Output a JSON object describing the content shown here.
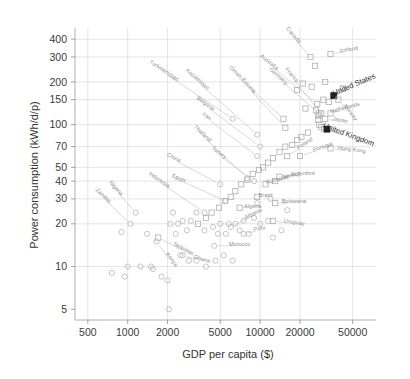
{
  "chart_data": {
    "type": "scatter",
    "title": "",
    "xlabel": "GDP per capita ($)",
    "ylabel": "Power consumption (kWh/d/p)",
    "xscale": "log",
    "yscale": "log",
    "xlim": [
      400,
      75000
    ],
    "ylim": [
      4.2,
      480
    ],
    "grid": true,
    "legend": "none",
    "xticks": [
      500,
      1000,
      2000,
      5000,
      10000,
      20000,
      50000
    ],
    "xtick_labels": [
      "500",
      "1000",
      "2000",
      "5000",
      "10000",
      "20000",
      "50000"
    ],
    "yticks": [
      5,
      10,
      20,
      30,
      40,
      50,
      70,
      100,
      150,
      200,
      300,
      400
    ],
    "ytick_labels": [
      "5",
      "10",
      "20",
      "30",
      "40",
      "50",
      "70",
      "100",
      "150",
      "200",
      "300",
      "400"
    ],
    "marker_types": [
      "square",
      "circle",
      "filled-square"
    ],
    "highlighted": [
      "United States",
      "United Kingdom"
    ],
    "points": [
      {
        "name": "Canada",
        "x": 24000,
        "y": 300,
        "marker": "square",
        "label_x": 17500,
        "label_y": 420
      },
      {
        "name": "Iceland",
        "x": 34000,
        "y": 315,
        "marker": "square",
        "label_x": 47000,
        "label_y": 330
      },
      {
        "name": "United States",
        "x": 36000,
        "y": 160,
        "marker": "filled-square",
        "label_x": 52000,
        "label_y": 185
      },
      {
        "name": "Norway",
        "x": 39000,
        "y": 150,
        "marker": "square",
        "label_x": 47000,
        "label_y": 120
      },
      {
        "name": "Australia",
        "x": 27000,
        "y": 140,
        "marker": "square",
        "label_x": 11500,
        "label_y": 270
      },
      {
        "name": "Germany",
        "x": 28000,
        "y": 120,
        "marker": "square",
        "label_x": 13500,
        "label_y": 215
      },
      {
        "name": "France",
        "x": 29000,
        "y": 120,
        "marker": "square",
        "label_x": 17000,
        "label_y": 220
      },
      {
        "name": "Netherlands",
        "x": 34000,
        "y": 120,
        "marker": "square",
        "label_x": 44000,
        "label_y": 128
      },
      {
        "name": "Japan",
        "x": 31000,
        "y": 110,
        "marker": "square",
        "label_x": 40000,
        "label_y": 105
      },
      {
        "name": "United Kingdom",
        "x": 32000,
        "y": 93,
        "marker": "filled-square",
        "label_x": 46000,
        "label_y": 82
      },
      {
        "name": "Hong Kong",
        "x": 34000,
        "y": 68,
        "marker": "square",
        "label_x": 49000,
        "label_y": 65
      },
      {
        "name": "Oman",
        "x": 15000,
        "y": 110,
        "marker": "square",
        "label_x": 6400,
        "label_y": 230
      },
      {
        "name": "Estonia",
        "x": 15500,
        "y": 95,
        "marker": "square",
        "label_x": 8000,
        "label_y": 185
      },
      {
        "name": "Portugal",
        "x": 20000,
        "y": 60,
        "marker": "square",
        "label_x": 30000,
        "label_y": 68
      },
      {
        "name": "Poland",
        "x": 16000,
        "y": 60,
        "marker": "square",
        "label_x": 22000,
        "label_y": 72
      },
      {
        "name": "Argentina",
        "x": 14000,
        "y": 43,
        "marker": "square",
        "label_x": 21000,
        "label_y": 44
      },
      {
        "name": "Mexico",
        "x": 13000,
        "y": 40,
        "marker": "square",
        "label_x": 17500,
        "label_y": 43
      },
      {
        "name": "Romania",
        "x": 11000,
        "y": 38,
        "marker": "square",
        "label_x": 13500,
        "label_y": 40
      },
      {
        "name": "Botswana",
        "x": 13000,
        "y": 28,
        "marker": "square",
        "label_x": 18000,
        "label_y": 28
      },
      {
        "name": "Brazil",
        "x": 9500,
        "y": 31,
        "marker": "square",
        "label_x": 11000,
        "label_y": 31
      },
      {
        "name": "Algeria",
        "x": 7000,
        "y": 26,
        "marker": "square",
        "label_x": 8800,
        "label_y": 26
      },
      {
        "name": "Uruguay",
        "x": 12500,
        "y": 21,
        "marker": "square",
        "label_x": 18000,
        "label_y": 20
      },
      {
        "name": "Albania",
        "x": 6000,
        "y": 19,
        "marker": "circle",
        "label_x": 9000,
        "label_y": 23
      },
      {
        "name": "Peru",
        "x": 7500,
        "y": 17,
        "marker": "circle",
        "label_x": 10000,
        "label_y": 18
      },
      {
        "name": "Morocco",
        "x": 4500,
        "y": 14,
        "marker": "circle",
        "label_x": 7000,
        "label_y": 14
      },
      {
        "name": "Turkmenistan",
        "x": 6200,
        "y": 110,
        "marker": "circle",
        "label_x": 1850,
        "label_y": 235
      },
      {
        "name": "Kazakhstan",
        "x": 9500,
        "y": 85,
        "marker": "circle",
        "label_x": 3300,
        "label_y": 205
      },
      {
        "name": "Bulgaria",
        "x": 10000,
        "y": 70,
        "marker": "circle",
        "label_x": 3800,
        "label_y": 138
      },
      {
        "name": "Iran",
        "x": 9500,
        "y": 60,
        "marker": "circle",
        "label_x": 3900,
        "label_y": 112
      },
      {
        "name": "Thailand",
        "x": 8000,
        "y": 42,
        "marker": "circle",
        "label_x": 3600,
        "label_y": 85
      },
      {
        "name": "Turkey",
        "x": 9000,
        "y": 40,
        "marker": "circle",
        "label_x": 4800,
        "label_y": 62
      },
      {
        "name": "China",
        "x": 5000,
        "y": 38,
        "marker": "circle",
        "label_x": 2200,
        "label_y": 57
      },
      {
        "name": "Egypt",
        "x": 5500,
        "y": 29,
        "marker": "circle",
        "label_x": 2400,
        "label_y": 41
      },
      {
        "name": "Indonesia",
        "x": 3800,
        "y": 24,
        "marker": "circle",
        "label_x": 1700,
        "label_y": 40
      },
      {
        "name": "Nigeria",
        "x": 1150,
        "y": 24,
        "marker": "circle",
        "label_x": 800,
        "label_y": 35
      },
      {
        "name": "Zambia",
        "x": 1050,
        "y": 20,
        "marker": "circle",
        "label_x": 640,
        "label_y": 31
      },
      {
        "name": "Tajikistan",
        "x": 1700,
        "y": 16,
        "marker": "square",
        "label_x": 2600,
        "label_y": 13
      },
      {
        "name": "Kenya",
        "x": 1650,
        "y": 15,
        "marker": "circle",
        "label_x": 2100,
        "label_y": 11
      },
      {
        "name": "Ghana",
        "x": 2600,
        "y": 12,
        "marker": "circle",
        "label_x": 3600,
        "label_y": 11
      }
    ],
    "unlabeled_points": [
      {
        "x": 26000,
        "y": 260,
        "marker": "square"
      },
      {
        "x": 21000,
        "y": 195,
        "marker": "square"
      },
      {
        "x": 24500,
        "y": 185,
        "marker": "square"
      },
      {
        "x": 31000,
        "y": 200,
        "marker": "square"
      },
      {
        "x": 42000,
        "y": 180,
        "marker": "square"
      },
      {
        "x": 19000,
        "y": 175,
        "marker": "square"
      },
      {
        "x": 30000,
        "y": 150,
        "marker": "square"
      },
      {
        "x": 33000,
        "y": 145,
        "marker": "square"
      },
      {
        "x": 22000,
        "y": 130,
        "marker": "square"
      },
      {
        "x": 26500,
        "y": 126,
        "marker": "square"
      },
      {
        "x": 27500,
        "y": 116,
        "marker": "square"
      },
      {
        "x": 27500,
        "y": 108,
        "marker": "square"
      },
      {
        "x": 28000,
        "y": 100,
        "marker": "square"
      },
      {
        "x": 29000,
        "y": 96,
        "marker": "square"
      },
      {
        "x": 30500,
        "y": 93,
        "marker": "square"
      },
      {
        "x": 23000,
        "y": 88,
        "marker": "square"
      },
      {
        "x": 20500,
        "y": 82,
        "marker": "square"
      },
      {
        "x": 19000,
        "y": 78,
        "marker": "square"
      },
      {
        "x": 17500,
        "y": 72,
        "marker": "square"
      },
      {
        "x": 15500,
        "y": 70,
        "marker": "square"
      },
      {
        "x": 14000,
        "y": 64,
        "marker": "square"
      },
      {
        "x": 12500,
        "y": 58,
        "marker": "square"
      },
      {
        "x": 11500,
        "y": 54,
        "marker": "square"
      },
      {
        "x": 10500,
        "y": 50,
        "marker": "square"
      },
      {
        "x": 9800,
        "y": 48,
        "marker": "square"
      },
      {
        "x": 8800,
        "y": 45,
        "marker": "square"
      },
      {
        "x": 8000,
        "y": 41,
        "marker": "square"
      },
      {
        "x": 7200,
        "y": 38,
        "marker": "square"
      },
      {
        "x": 6500,
        "y": 34,
        "marker": "square"
      },
      {
        "x": 6000,
        "y": 31,
        "marker": "square"
      },
      {
        "x": 5400,
        "y": 29,
        "marker": "square"
      },
      {
        "x": 4900,
        "y": 26,
        "marker": "square"
      },
      {
        "x": 4300,
        "y": 24,
        "marker": "square"
      },
      {
        "x": 3900,
        "y": 22,
        "marker": "square"
      },
      {
        "x": 3400,
        "y": 20,
        "marker": "square"
      },
      {
        "x": 5000,
        "y": 20,
        "marker": "circle"
      },
      {
        "x": 5800,
        "y": 20,
        "marker": "circle"
      },
      {
        "x": 6500,
        "y": 20,
        "marker": "circle"
      },
      {
        "x": 4400,
        "y": 19,
        "marker": "circle"
      },
      {
        "x": 3800,
        "y": 18,
        "marker": "circle"
      },
      {
        "x": 4800,
        "y": 17,
        "marker": "circle"
      },
      {
        "x": 5500,
        "y": 17,
        "marker": "circle"
      },
      {
        "x": 7000,
        "y": 18,
        "marker": "circle"
      },
      {
        "x": 8200,
        "y": 17,
        "marker": "circle"
      },
      {
        "x": 3300,
        "y": 24,
        "marker": "circle"
      },
      {
        "x": 3000,
        "y": 21,
        "marker": "circle"
      },
      {
        "x": 2800,
        "y": 18,
        "marker": "circle"
      },
      {
        "x": 2300,
        "y": 17,
        "marker": "circle"
      },
      {
        "x": 2500,
        "y": 12,
        "marker": "circle"
      },
      {
        "x": 2900,
        "y": 11,
        "marker": "circle"
      },
      {
        "x": 3300,
        "y": 11,
        "marker": "circle"
      },
      {
        "x": 3900,
        "y": 10,
        "marker": "circle"
      },
      {
        "x": 4600,
        "y": 11,
        "marker": "circle"
      },
      {
        "x": 5300,
        "y": 12,
        "marker": "circle"
      },
      {
        "x": 6200,
        "y": 11,
        "marker": "circle"
      },
      {
        "x": 1400,
        "y": 17,
        "marker": "circle"
      },
      {
        "x": 1500,
        "y": 10,
        "marker": "circle"
      },
      {
        "x": 1250,
        "y": 10,
        "marker": "circle"
      },
      {
        "x": 1000,
        "y": 10,
        "marker": "circle"
      },
      {
        "x": 950,
        "y": 8.5,
        "marker": "circle"
      },
      {
        "x": 760,
        "y": 9,
        "marker": "circle"
      },
      {
        "x": 900,
        "y": 17.5,
        "marker": "circle"
      },
      {
        "x": 1800,
        "y": 8.5,
        "marker": "circle"
      },
      {
        "x": 2000,
        "y": 8,
        "marker": "circle"
      },
      {
        "x": 2050,
        "y": 5,
        "marker": "circle"
      },
      {
        "x": 1550,
        "y": 9.6,
        "marker": "circle"
      },
      {
        "x": 2100,
        "y": 20,
        "marker": "circle"
      },
      {
        "x": 2400,
        "y": 20,
        "marker": "circle"
      },
      {
        "x": 2600,
        "y": 21,
        "marker": "circle"
      },
      {
        "x": 2200,
        "y": 24,
        "marker": "circle"
      },
      {
        "x": 7500,
        "y": 21,
        "marker": "circle"
      },
      {
        "x": 9000,
        "y": 22,
        "marker": "circle"
      },
      {
        "x": 10000,
        "y": 20,
        "marker": "circle"
      },
      {
        "x": 11500,
        "y": 21,
        "marker": "circle"
      },
      {
        "x": 12500,
        "y": 16,
        "marker": "circle"
      },
      {
        "x": 14500,
        "y": 18,
        "marker": "circle"
      },
      {
        "x": 16000,
        "y": 25,
        "marker": "circle"
      },
      {
        "x": 9500,
        "y": 28,
        "marker": "circle"
      },
      {
        "x": 12000,
        "y": 30,
        "marker": "circle"
      }
    ]
  }
}
